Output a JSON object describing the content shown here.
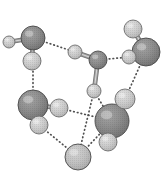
{
  "figure": {
    "background_color": "#ffffff",
    "width": 164,
    "height": 173,
    "style": "grayscale halftone space-filling spheres"
  },
  "legend": {
    "oxygen_label": "O",
    "hydrogen_label": "H",
    "covalent_bond_label": "covalent bond",
    "hydrogen_bond_label": "hydrogen bond"
  },
  "colors": {
    "oxygen_fill": "#8a8a8a",
    "oxygen_fill_light": "#9a9a9a",
    "oxygen_stroke": "#4a4a4a",
    "hydrogen_fill": "#c9c9c9",
    "hydrogen_fill_light": "#d6d6d6",
    "hydrogen_stroke": "#6e6e6e",
    "covalent_bond": "#9b9b9b",
    "hydrogen_bond": "#4f4f4f",
    "background": "#ffffff"
  },
  "atoms": [
    {
      "id": "O1",
      "element": "O",
      "label": "O",
      "cx": 33,
      "cy": 38,
      "r": 12,
      "shade": "dark"
    },
    {
      "id": "H1a",
      "element": "H",
      "label": "H",
      "cx": 9,
      "cy": 42,
      "r": 6,
      "shade": "light"
    },
    {
      "id": "H1b",
      "element": "H",
      "label": "H",
      "cx": 32,
      "cy": 61,
      "r": 9,
      "shade": "light"
    },
    {
      "id": "O2",
      "element": "O",
      "label": "O",
      "cx": 98,
      "cy": 60,
      "r": 9,
      "shade": "dark"
    },
    {
      "id": "H2a",
      "element": "H",
      "label": "H",
      "cx": 75,
      "cy": 52,
      "r": 7,
      "shade": "light"
    },
    {
      "id": "H2b",
      "element": "H",
      "label": "H",
      "cx": 94,
      "cy": 91,
      "r": 7,
      "shade": "light"
    },
    {
      "id": "O3",
      "element": "O",
      "label": "O",
      "cx": 146,
      "cy": 52,
      "r": 14,
      "shade": "dark"
    },
    {
      "id": "H3a",
      "element": "H",
      "label": "H",
      "cx": 133,
      "cy": 29,
      "r": 9,
      "shade": "light"
    },
    {
      "id": "H3b",
      "element": "H",
      "label": "H",
      "cx": 129,
      "cy": 57,
      "r": 7,
      "shade": "light"
    },
    {
      "id": "O4",
      "element": "O",
      "label": "O",
      "cx": 33,
      "cy": 105,
      "r": 15,
      "shade": "dark"
    },
    {
      "id": "H4a",
      "element": "H",
      "label": "H",
      "cx": 59,
      "cy": 108,
      "r": 9,
      "shade": "light"
    },
    {
      "id": "H4b",
      "element": "H",
      "label": "H",
      "cx": 39,
      "cy": 125,
      "r": 9,
      "shade": "light"
    },
    {
      "id": "O5",
      "element": "O",
      "label": "O",
      "cx": 112,
      "cy": 121,
      "r": 17,
      "shade": "dark"
    },
    {
      "id": "H5a",
      "element": "H",
      "label": "H",
      "cx": 125,
      "cy": 99,
      "r": 10,
      "shade": "light"
    },
    {
      "id": "H5b",
      "element": "H",
      "label": "H",
      "cx": 108,
      "cy": 142,
      "r": 9,
      "shade": "light"
    },
    {
      "id": "O6",
      "element": "O",
      "label": "O",
      "cx": 78,
      "cy": 157,
      "r": 13,
      "shade": "light"
    }
  ],
  "covalent_bonds": [
    {
      "from": "O1",
      "to": "H1a"
    },
    {
      "from": "O1",
      "to": "H1b"
    },
    {
      "from": "O2",
      "to": "H2a"
    },
    {
      "from": "O2",
      "to": "H2b"
    },
    {
      "from": "O3",
      "to": "H3a"
    },
    {
      "from": "O3",
      "to": "H3b"
    },
    {
      "from": "O4",
      "to": "H4a"
    },
    {
      "from": "O4",
      "to": "H4b"
    },
    {
      "from": "O5",
      "to": "H5a"
    },
    {
      "from": "O5",
      "to": "H5b"
    }
  ],
  "hydrogen_bonds": [
    {
      "from": "O1",
      "to": "H2a"
    },
    {
      "from": "O2",
      "to": "H3b"
    },
    {
      "from": "O1",
      "to": "O4"
    },
    {
      "from": "O3",
      "to": "H5a"
    },
    {
      "from": "H2b",
      "to": "O5"
    },
    {
      "from": "H4a",
      "to": "O5"
    },
    {
      "from": "H4b",
      "to": "O6"
    },
    {
      "from": "O6",
      "to": "O5"
    },
    {
      "from": "H2b",
      "to": "O6"
    }
  ]
}
